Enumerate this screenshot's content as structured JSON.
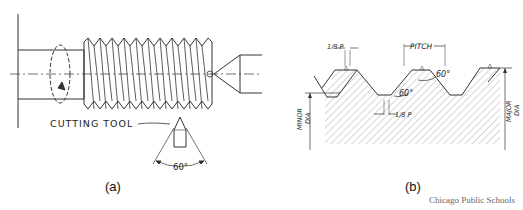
{
  "figure_a": {
    "caption": "(a)",
    "tool_label": "CUTTING TOOL",
    "tool_angle": "60°"
  },
  "figure_b": {
    "caption": "(b)",
    "pitch_label": "PITCH",
    "crest_flat_label": "1/8 P",
    "root_flat_label": "1/8 P",
    "angle_top": "60°",
    "angle_mid": "60°",
    "minor_dia_label": [
      "MINOR",
      "DIA"
    ],
    "major_dia_label": [
      "MAJOR",
      "DIA"
    ]
  },
  "credit": "Chicago Public Schools",
  "colors": {
    "line": "#333333",
    "hatch": "#888888",
    "background": "#ffffff"
  }
}
